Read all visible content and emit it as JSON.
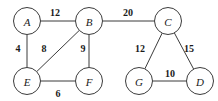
{
  "figure": {
    "width": 218,
    "height": 101,
    "background_color": "#ffffff",
    "stroke_color": "#3b3b3b",
    "text_color": "#1a1a1a"
  },
  "chart_data": {
    "type": "diagram",
    "graph_kind": "weighted-undirected-graph",
    "title": "",
    "node_radius": 13.5,
    "nodes": [
      {
        "id": "A",
        "label": "A",
        "x": 27,
        "y": 21
      },
      {
        "id": "B",
        "label": "B",
        "x": 89,
        "y": 21
      },
      {
        "id": "C",
        "label": "C",
        "x": 168,
        "y": 21
      },
      {
        "id": "E",
        "label": "E",
        "x": 27,
        "y": 81
      },
      {
        "id": "F",
        "label": "F",
        "x": 89,
        "y": 81
      },
      {
        "id": "G",
        "label": "G",
        "x": 139,
        "y": 81
      },
      {
        "id": "D",
        "label": "D",
        "x": 200,
        "y": 81
      }
    ],
    "edges": [
      {
        "source": "A",
        "target": "B",
        "weight": 12,
        "label": "12",
        "label_x": 55,
        "label_y": 12
      },
      {
        "source": "B",
        "target": "C",
        "weight": 20,
        "label": "20",
        "label_x": 128,
        "label_y": 12
      },
      {
        "source": "A",
        "target": "E",
        "weight": 4,
        "label": "4",
        "label_x": 18,
        "label_y": 48
      },
      {
        "source": "E",
        "target": "B",
        "weight": 8,
        "label": "8",
        "label_x": 44,
        "label_y": 48
      },
      {
        "source": "B",
        "target": "F",
        "weight": 9,
        "label": "9",
        "label_x": 83,
        "label_y": 48
      },
      {
        "source": "E",
        "target": "F",
        "weight": 6,
        "label": "6",
        "label_x": 58,
        "label_y": 93
      },
      {
        "source": "C",
        "target": "G",
        "weight": 12,
        "label": "12",
        "label_x": 140,
        "label_y": 48
      },
      {
        "source": "C",
        "target": "D",
        "weight": 15,
        "label": "15",
        "label_x": 189,
        "label_y": 48
      },
      {
        "source": "G",
        "target": "D",
        "weight": 10,
        "label": "10",
        "label_x": 170,
        "label_y": 73
      }
    ],
    "components": [
      {
        "name": "left-component",
        "nodes": [
          "A",
          "B",
          "E",
          "F"
        ]
      },
      {
        "name": "right-component",
        "nodes": [
          "C",
          "G",
          "D"
        ]
      }
    ],
    "xlabel": "",
    "ylabel": "",
    "legend": [],
    "grid": false
  }
}
